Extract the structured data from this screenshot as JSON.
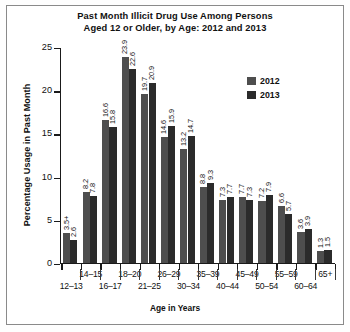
{
  "chart_data": {
    "type": "bar",
    "title": "Past Month Illicit Drug Use Among Persons Aged 12 or Older, by Age: 2012 and 2013",
    "title_line1": "Past Month Illicit Drug Use Among Persons",
    "title_line2": "Aged 12 or Older, by Age: 2012 and 2013",
    "xlabel": "Age in Years",
    "ylabel": "Percentage Usage in Past Month",
    "ylim": [
      0,
      25
    ],
    "yticks": [
      0,
      5,
      10,
      15,
      20,
      25
    ],
    "grid": false,
    "legend_position": "top-right",
    "categories": [
      "12–13",
      "14–15",
      "16–17",
      "18–20",
      "21–25",
      "26–29",
      "30–34",
      "35–39",
      "40–44",
      "45–49",
      "50–54",
      "55–59",
      "60–64",
      "65+"
    ],
    "series": [
      {
        "name": "2012",
        "color": "#4e4e4e",
        "values": [
          3.5,
          8.2,
          16.6,
          23.9,
          19.7,
          14.6,
          13.2,
          8.8,
          7.3,
          7.7,
          7.2,
          6.6,
          3.6,
          1.3
        ],
        "labels": [
          "3.5+",
          "8.2",
          "16.6",
          "23.9",
          "19.7",
          "14.6",
          "13.2",
          "8.8",
          "7.3",
          "7.7",
          "7.2",
          "6.6",
          "3.6",
          "1.3"
        ]
      },
      {
        "name": "2013",
        "color": "#2b2b2b",
        "values": [
          2.6,
          7.8,
          15.8,
          22.6,
          20.9,
          15.9,
          14.7,
          9.3,
          7.7,
          7.3,
          7.9,
          5.7,
          3.9,
          1.5
        ],
        "labels": [
          "2.6",
          "7.8",
          "15.8",
          "22.6",
          "20.9",
          "15.9",
          "14.7",
          "9.3",
          "7.7",
          "7.3",
          "7.9",
          "5.7",
          "3.9",
          "1.5"
        ]
      }
    ]
  },
  "legend": {
    "entries": [
      {
        "label": "2012",
        "color": "#4e4e4e"
      },
      {
        "label": "2013",
        "color": "#2b2b2b"
      }
    ]
  }
}
